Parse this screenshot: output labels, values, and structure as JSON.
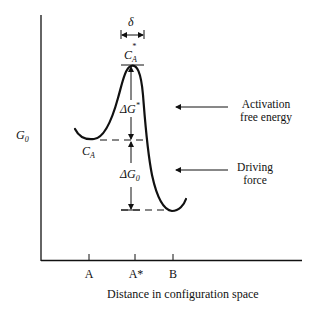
{
  "diagram": {
    "y_axis_label": "G",
    "y_axis_label_sub": "0",
    "x_axis_label": "Distance in configuration space",
    "ticks": [
      {
        "label": "A",
        "x": 89
      },
      {
        "label": "A*",
        "x": 135
      },
      {
        "label": "B",
        "x": 173
      }
    ],
    "delta_label": "δ",
    "state_initial": {
      "base": "C",
      "sub": "A"
    },
    "state_activated": {
      "base": "C",
      "sub": "A",
      "sup": "*"
    },
    "activation_gap": {
      "base": "ΔG",
      "sup": "*"
    },
    "driving_gap": {
      "base": "ΔG",
      "sub": "0"
    },
    "annotations": {
      "activation_line1": "Activation",
      "activation_line2": "free energy",
      "driving_line1": "Driving",
      "driving_line2": "force"
    },
    "colors": {
      "ink": "#111111",
      "background": "#ffffff"
    }
  }
}
